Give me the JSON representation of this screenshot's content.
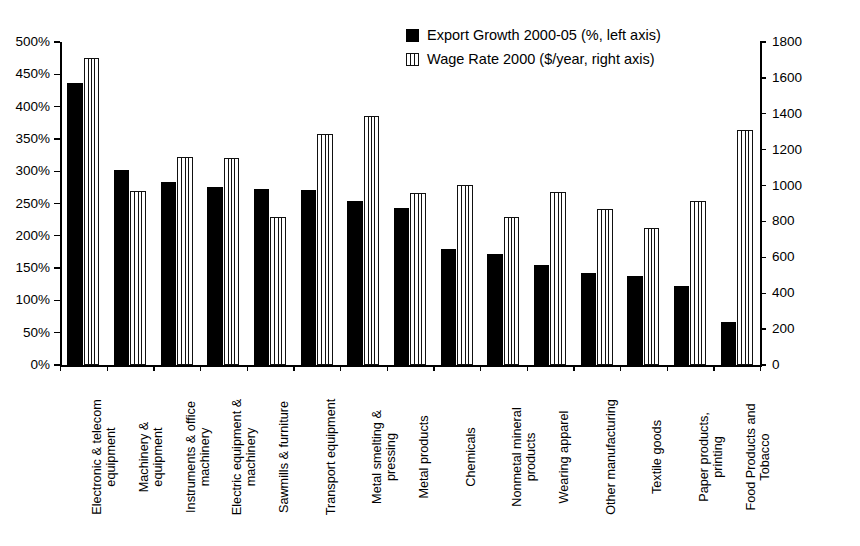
{
  "chart_data": {
    "type": "bar",
    "title": "",
    "xlabel": "",
    "ylabel": "",
    "grid": false,
    "legend_position": "top-center",
    "categories": [
      "Electronic & telecom\nequipment",
      "Machinery &\nequipment",
      "Instruments & office\nmachinery",
      "Electric equipment &\nmachinery",
      "Sawmills & furniture",
      "Transport equipment",
      "Metal smelting &\npressing",
      "Metal products",
      "Chemicals",
      "Nonmetal mineral\nproducts",
      "Wearing apparel",
      "Other manufacturing",
      "Textile goods",
      "Paper products,\nprinting",
      "Food Products and\nTobacco"
    ],
    "series": [
      {
        "name": "Export Growth 2000-05 (%, left axis)",
        "axis": "left",
        "style": "solid-black",
        "values": [
          437,
          302,
          283,
          275,
          272,
          271,
          254,
          243,
          180,
          172,
          155,
          142,
          138,
          122,
          67
        ]
      },
      {
        "name": "Wage Rate 2000 ($/year, right axis)",
        "axis": "right",
        "style": "vertical-hatch",
        "values": [
          1710,
          970,
          1160,
          1155,
          825,
          1285,
          1390,
          960,
          1005,
          825,
          965,
          870,
          765,
          915,
          1310
        ]
      }
    ],
    "left_axis": {
      "min": 0,
      "max": 500,
      "step": 50,
      "suffix": "%",
      "tick_labels": [
        "0%",
        "50%",
        "100%",
        "150%",
        "200%",
        "250%",
        "300%",
        "350%",
        "400%",
        "450%",
        "500%"
      ]
    },
    "right_axis": {
      "min": 0,
      "max": 1800,
      "step": 200,
      "tick_labels": [
        "0",
        "200",
        "400",
        "600",
        "800",
        "1000",
        "1200",
        "1400",
        "1600",
        "1800"
      ]
    }
  },
  "legend": {
    "items": [
      {
        "label": "Export Growth 2000-05 (%, left axis)",
        "swatch": "solid-black-swatch"
      },
      {
        "label": "Wage Rate 2000 ($/year, right axis)",
        "swatch": "vertical-hatch-swatch"
      }
    ]
  },
  "colors": {
    "series_1": "#000000",
    "series_2": "#ffffff",
    "axis": "#000000",
    "background": "#ffffff"
  }
}
